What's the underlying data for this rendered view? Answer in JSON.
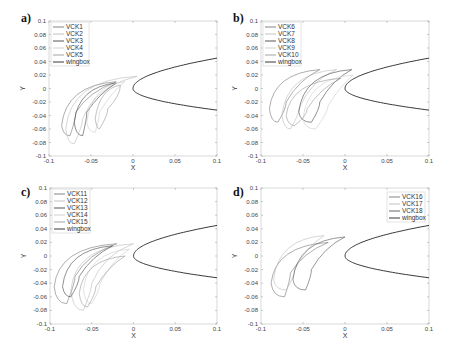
{
  "chart_data": [
    {
      "panel": "a)",
      "type": "line",
      "xlabel": "X",
      "ylabel": "Y",
      "xlim": [
        -0.1,
        0.1
      ],
      "ylim": [
        -0.1,
        0.1
      ],
      "xticks": [
        "-0.1",
        "-0.05",
        "0",
        "0.05",
        "0.1"
      ],
      "yticks": [
        "0.1",
        "0.08",
        "0.06",
        "0.04",
        "0.02",
        "0",
        "-0.02",
        "-0.04",
        "-0.06",
        "-0.08",
        "-0.1"
      ],
      "grid": false,
      "legend_position": "upper-left",
      "series": [
        {
          "name": "VCK1",
          "color": "#777777",
          "tip": [
            -0.02,
            0.01
          ],
          "left": [
            -0.085,
            -0.055
          ],
          "bottom": [
            -0.075,
            -0.07
          ],
          "inner": [
            -0.068,
            -0.035
          ]
        },
        {
          "name": "VCK2",
          "color": "#bbbbbb",
          "tip": [
            0.005,
            0.018
          ],
          "left": [
            -0.08,
            -0.06
          ],
          "bottom": [
            -0.07,
            -0.082
          ],
          "inner": [
            -0.06,
            -0.045
          ]
        },
        {
          "name": "VCK3",
          "color": "#444444",
          "tip": [
            -0.02,
            0.008
          ],
          "left": [
            -0.07,
            -0.05
          ],
          "bottom": [
            -0.06,
            -0.07
          ],
          "inner": [
            -0.055,
            -0.035
          ]
        },
        {
          "name": "VCK4",
          "color": "#cccccc",
          "tip": [
            -0.01,
            0.01
          ],
          "left": [
            -0.055,
            -0.05
          ],
          "bottom": [
            -0.045,
            -0.065
          ],
          "inner": [
            -0.04,
            -0.035
          ]
        },
        {
          "name": "VCK5",
          "color": "#999999",
          "tip": [
            -0.015,
            0.005
          ],
          "left": [
            -0.045,
            -0.045
          ],
          "bottom": [
            -0.04,
            -0.06
          ],
          "inner": [
            -0.03,
            -0.03
          ]
        },
        {
          "name": "wingbox",
          "color": "#222222"
        }
      ]
    },
    {
      "panel": "b)",
      "type": "line",
      "xlabel": "X",
      "ylabel": "Y",
      "xlim": [
        -0.1,
        0.1
      ],
      "ylim": [
        -0.1,
        0.1
      ],
      "xticks": [
        "-0.1",
        "-0.05",
        "0",
        "0.05",
        "0.1"
      ],
      "yticks": [
        "0.1",
        "0.08",
        "0.06",
        "0.04",
        "0.02",
        "0",
        "-0.02",
        "-0.04",
        "-0.06",
        "-0.08",
        "-0.1"
      ],
      "grid": false,
      "legend_position": "upper-left",
      "series": [
        {
          "name": "VCK6",
          "color": "#777777",
          "tip": [
            -0.03,
            0.028
          ],
          "left": [
            -0.09,
            -0.03
          ],
          "bottom": [
            -0.08,
            -0.05
          ],
          "inner": [
            -0.07,
            -0.02
          ]
        },
        {
          "name": "VCK7",
          "color": "#bbbbbb",
          "tip": [
            -0.01,
            0.028
          ],
          "left": [
            -0.075,
            -0.04
          ],
          "bottom": [
            -0.065,
            -0.06
          ],
          "inner": [
            -0.055,
            -0.03
          ]
        },
        {
          "name": "VCK8",
          "color": "#444444",
          "tip": [
            0.008,
            0.028
          ],
          "left": [
            -0.055,
            -0.035
          ],
          "bottom": [
            -0.04,
            -0.05
          ],
          "inner": [
            -0.03,
            -0.02
          ]
        },
        {
          "name": "VCK9",
          "color": "#cccccc",
          "tip": [
            0.01,
            0.02
          ],
          "left": [
            -0.05,
            -0.045
          ],
          "bottom": [
            -0.035,
            -0.06
          ],
          "inner": [
            -0.02,
            -0.025
          ]
        },
        {
          "name": "VCK10",
          "color": "#999999",
          "tip": [
            -0.005,
            0.015
          ],
          "left": [
            -0.07,
            -0.04
          ],
          "bottom": [
            -0.06,
            -0.055
          ],
          "inner": [
            -0.045,
            -0.03
          ]
        },
        {
          "name": "wingbox",
          "color": "#222222"
        }
      ]
    },
    {
      "panel": "c)",
      "type": "line",
      "xlabel": "X",
      "ylabel": "Y",
      "xlim": [
        -0.1,
        0.1
      ],
      "ylim": [
        -0.1,
        0.1
      ],
      "xticks": [
        "-0.1",
        "-0.05",
        "0",
        "0.05",
        "0.1"
      ],
      "yticks": [
        "0.1",
        "0.08",
        "0.06",
        "0.04",
        "0.02",
        "0",
        "-0.02",
        "-0.04",
        "-0.06",
        "-0.08",
        "-0.1"
      ],
      "grid": false,
      "legend_position": "upper-left",
      "series": [
        {
          "name": "VCK11",
          "color": "#777777",
          "tip": [
            -0.02,
            0.018
          ],
          "left": [
            -0.095,
            -0.045
          ],
          "bottom": [
            -0.08,
            -0.07
          ],
          "inner": [
            -0.07,
            -0.03
          ]
        },
        {
          "name": "VCK12",
          "color": "#bbbbbb",
          "tip": [
            0.0,
            0.018
          ],
          "left": [
            -0.075,
            -0.05
          ],
          "bottom": [
            -0.06,
            -0.08
          ],
          "inner": [
            -0.05,
            -0.04
          ]
        },
        {
          "name": "VCK13",
          "color": "#444444",
          "tip": [
            -0.025,
            0.015
          ],
          "left": [
            -0.085,
            -0.045
          ],
          "bottom": [
            -0.075,
            -0.06
          ],
          "inner": [
            -0.065,
            -0.03
          ]
        },
        {
          "name": "VCK14",
          "color": "#cccccc",
          "tip": [
            -0.005,
            0.01
          ],
          "left": [
            -0.06,
            -0.05
          ],
          "bottom": [
            -0.05,
            -0.07
          ],
          "inner": [
            -0.04,
            -0.04
          ]
        },
        {
          "name": "VCK15",
          "color": "#999999",
          "tip": [
            -0.01,
            0.0
          ],
          "left": [
            -0.065,
            -0.055
          ],
          "bottom": [
            -0.055,
            -0.075
          ],
          "inner": [
            -0.045,
            -0.045
          ]
        },
        {
          "name": "wingbox",
          "color": "#222222"
        }
      ]
    },
    {
      "panel": "d)",
      "type": "line",
      "xlabel": "X",
      "ylabel": "Y",
      "xlim": [
        -0.1,
        0.1
      ],
      "ylim": [
        -0.1,
        0.1
      ],
      "xticks": [
        "-0.1",
        "-0.05",
        "0",
        "0.05",
        "0.1"
      ],
      "yticks": [
        "0.1",
        "0.08",
        "0.06",
        "0.04",
        "0.02",
        "0",
        "-0.02",
        "-0.04",
        "-0.06",
        "-0.08",
        "-0.1"
      ],
      "grid": false,
      "legend_position": "upper-right",
      "series": [
        {
          "name": "VCK16",
          "color": "#777777",
          "tip": [
            -0.02,
            0.02
          ],
          "left": [
            -0.088,
            -0.04
          ],
          "bottom": [
            -0.072,
            -0.06
          ],
          "inner": [
            -0.065,
            -0.025
          ]
        },
        {
          "name": "VCK17",
          "color": "#bbbbbb",
          "tip": [
            -0.025,
            0.03
          ],
          "left": [
            -0.085,
            -0.035
          ],
          "bottom": [
            -0.07,
            -0.05
          ],
          "inner": [
            -0.06,
            -0.02
          ]
        },
        {
          "name": "VCK18",
          "color": "#555555",
          "tip": [
            0.0,
            0.028
          ],
          "left": [
            -0.062,
            -0.035
          ],
          "bottom": [
            -0.047,
            -0.05
          ],
          "inner": [
            -0.04,
            -0.02
          ]
        },
        {
          "name": "wingbox",
          "color": "#222222"
        }
      ]
    }
  ]
}
